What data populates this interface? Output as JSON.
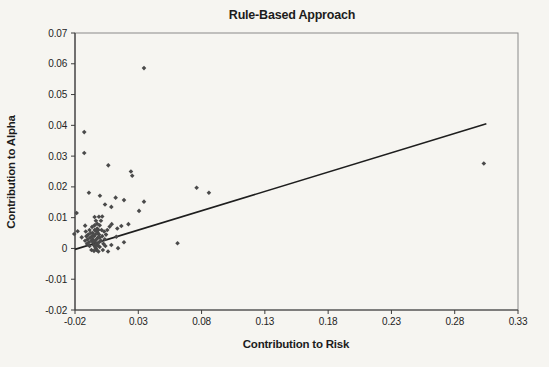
{
  "page": {
    "background": "#f6f5f1"
  },
  "chart_data": {
    "type": "scatter",
    "title": "Rule-Based Approach",
    "xlabel": "Contribution to Risk",
    "ylabel": "Contribution to Alpha",
    "grid": false,
    "legend": false,
    "x_axis": {
      "min": -0.02,
      "max": 0.33,
      "tick_step": 0.05,
      "tick_labels": [
        "-0.02",
        "0.03",
        "0.08",
        "0.13",
        "0.18",
        "0.23",
        "0.28",
        "0.33"
      ]
    },
    "y_axis": {
      "min": -0.02,
      "max": 0.07,
      "tick_step": 0.01,
      "tick_labels": [
        "0.07",
        "0.06",
        "0.05",
        "0.04",
        "0.03",
        "0.02",
        "0.01",
        "0",
        "-0.01",
        "-0.02"
      ]
    },
    "marker": {
      "shape": "diamond",
      "color": "#4a4a4a",
      "size": 2.3
    },
    "axis_color": "#3c3c3c",
    "border_color": "#8a8a8a",
    "trendline": {
      "x1": -0.02,
      "y1": -0.0003,
      "x2": 0.305,
      "y2": 0.0405,
      "color": "#1e1e1e",
      "width": 1.6
    },
    "points": [
      [
        0.0345,
        0.0586
      ],
      [
        -0.0127,
        0.0378
      ],
      [
        -0.0127,
        0.031
      ],
      [
        0.0063,
        0.027
      ],
      [
        0.0242,
        0.025
      ],
      [
        0.0252,
        0.0236
      ],
      [
        0.303,
        0.0276
      ],
      [
        0.0761,
        0.0197
      ],
      [
        0.0858,
        0.0181
      ],
      [
        -0.009,
        0.0181
      ],
      [
        -0.0003,
        0.0171
      ],
      [
        0.0121,
        0.0165
      ],
      [
        0.0037,
        0.0143
      ],
      [
        0.0087,
        0.0135
      ],
      [
        0.0187,
        0.0157
      ],
      [
        0.0345,
        0.0152
      ],
      [
        0.0306,
        0.0122
      ],
      [
        -0.0187,
        0.0115
      ],
      [
        -0.0045,
        0.0102
      ],
      [
        -0.0011,
        0.0103
      ],
      [
        0.0015,
        0.0104
      ],
      [
        0.061,
        0.0017
      ],
      [
        0.0074,
        0.0071
      ],
      [
        0.0134,
        0.0065
      ],
      [
        0.0166,
        0.0073
      ],
      [
        0.0222,
        0.0079
      ],
      [
        -0.0179,
        0.0056
      ],
      [
        -0.0206,
        0.0047
      ],
      [
        -0.0147,
        0.0036
      ],
      [
        -0.012,
        0.0074
      ],
      [
        0.009,
        0.0079
      ],
      [
        0.0126,
        0.0038
      ],
      [
        0.0187,
        0.002
      ],
      [
        0.0087,
        0.0011
      ],
      [
        0.014,
        0.0001
      ],
      [
        0.0061,
        -0.001
      ],
      [
        -0.003,
        0.003
      ],
      [
        -0.004,
        0.0025
      ],
      [
        -0.002,
        0.0035
      ],
      [
        -0.005,
        0.004
      ],
      [
        -0.001,
        0.002
      ],
      [
        -0.006,
        0.003
      ],
      [
        -0.003,
        0.0015
      ],
      [
        -0.004,
        0.0045
      ],
      [
        -0.002,
        0.005
      ],
      [
        -0.0005,
        0.0035
      ],
      [
        -0.007,
        0.0025
      ],
      [
        -0.005,
        0.001
      ],
      [
        -0.003,
        0.0055
      ],
      [
        -0.001,
        0.0045
      ],
      [
        -0.006,
        0.005
      ],
      [
        -0.004,
        0.0005
      ],
      [
        -0.002,
        0.001
      ],
      [
        -0.0045,
        0.006
      ],
      [
        -0.0025,
        0.0065
      ],
      [
        -0.0065,
        0.004
      ],
      [
        -0.008,
        0.0035
      ],
      [
        -0.0035,
        0.0
      ],
      [
        -0.0015,
        0.006
      ],
      [
        -0.0055,
        0.002
      ],
      [
        -0.0075,
        0.005
      ],
      [
        -0.009,
        0.002
      ],
      [
        -0.0005,
        0.0005
      ],
      [
        0.0005,
        0.0025
      ],
      [
        0.0015,
        0.004
      ],
      [
        -0.0095,
        0.0045
      ],
      [
        -0.01,
        0.003
      ],
      [
        -0.0085,
        0.006
      ],
      [
        -0.0025,
        0.008
      ],
      [
        -0.0045,
        0.0075
      ],
      [
        -0.0065,
        0.007
      ],
      [
        -0.011,
        0.004
      ],
      [
        -0.0105,
        0.0015
      ],
      [
        0.0025,
        0.0015
      ],
      [
        0.0035,
        0.003
      ],
      [
        -0.0005,
        0.0075
      ],
      [
        -0.003,
        -0.0005
      ],
      [
        -0.005,
        -0.0008
      ],
      [
        -0.0015,
        -0.001
      ],
      [
        0.001,
        0.006
      ],
      [
        0.003,
        0.0055
      ],
      [
        -0.012,
        0.0025
      ],
      [
        -0.0115,
        0.0055
      ],
      [
        0.0045,
        0.0045
      ],
      [
        0.002,
        -0.0005
      ],
      [
        0.004,
        0.0008
      ],
      [
        -0.0085,
        0.0008
      ],
      [
        -0.007,
        -0.0005
      ],
      [
        0.0005,
        0.009
      ],
      [
        -0.0035,
        0.009
      ],
      [
        0.0055,
        0.006
      ]
    ]
  }
}
